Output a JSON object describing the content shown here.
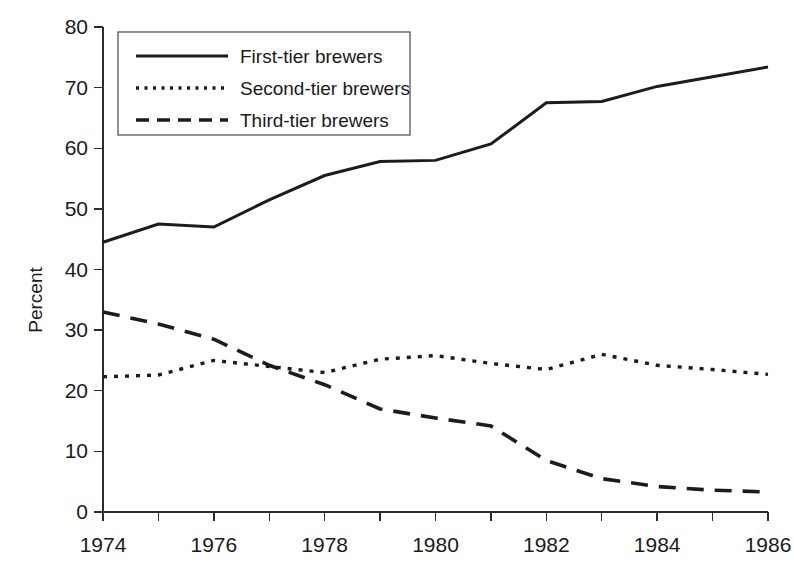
{
  "chart_data": {
    "type": "line",
    "title": "",
    "subtitle": "",
    "xlabel": "",
    "ylabel": "Percent",
    "x": [
      1974,
      1975,
      1976,
      1977,
      1978,
      1979,
      1980,
      1981,
      1982,
      1983,
      1984,
      1985,
      1986
    ],
    "xlim": [
      1974,
      1986
    ],
    "ylim": [
      0,
      80
    ],
    "x_tick_labels": [
      "1974",
      "1976",
      "1978",
      "1980",
      "1982",
      "1984",
      "1986"
    ],
    "x_tick_values": [
      1974,
      1976,
      1978,
      1980,
      1982,
      1984,
      1986
    ],
    "x_minor_tick_values": [
      1975,
      1977,
      1979,
      1981,
      1983,
      1985
    ],
    "y_tick_labels": [
      "0",
      "10",
      "20",
      "30",
      "40",
      "50",
      "60",
      "70",
      "80"
    ],
    "y_tick_values": [
      0,
      10,
      20,
      30,
      40,
      50,
      60,
      70,
      80
    ],
    "grid": false,
    "legend_position": "top-left",
    "series": [
      {
        "name": "First-tier brewers",
        "style": "solid",
        "color": "#1c1c1c",
        "values": [
          44.5,
          47.5,
          47.0,
          51.5,
          55.5,
          57.8,
          58.0,
          60.7,
          67.5,
          67.7,
          70.2,
          71.8,
          73.4
        ]
      },
      {
        "name": "Second-tier brewers",
        "style": "dotted",
        "color": "#1c1c1c",
        "values": [
          22.3,
          22.6,
          25.0,
          24.0,
          23.0,
          25.2,
          25.8,
          24.5,
          23.5,
          26.0,
          24.2,
          23.5,
          22.7
        ]
      },
      {
        "name": "Third-tier brewers",
        "style": "dashed",
        "color": "#1c1c1c",
        "values": [
          33.0,
          31.0,
          28.5,
          24.2,
          21.0,
          17.0,
          15.5,
          14.2,
          8.5,
          5.5,
          4.2,
          3.6,
          3.3
        ]
      }
    ]
  },
  "legend": {
    "entries": [
      {
        "label": "First-tier brewers",
        "style": "solid"
      },
      {
        "label": "Second-tier brewers",
        "style": "dotted"
      },
      {
        "label": "Third-tier brewers",
        "style": "dashed"
      }
    ]
  },
  "axes": {
    "y_axis_title": "Percent"
  }
}
